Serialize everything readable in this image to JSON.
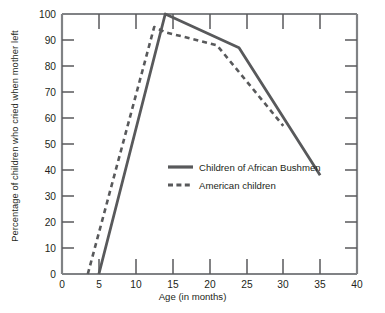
{
  "chart_data": {
    "type": "line",
    "title": "",
    "xlabel": "Age (in months)",
    "ylabel": "Percentage of children who cried when mother left",
    "xlim": [
      0,
      40
    ],
    "ylim": [
      0,
      100
    ],
    "xticks": [
      0,
      5,
      10,
      15,
      20,
      25,
      30,
      35,
      40
    ],
    "yticks": [
      0,
      10,
      20,
      30,
      40,
      50,
      60,
      70,
      80,
      90,
      100
    ],
    "grid": false,
    "legend_position": "center",
    "line_color": "#58595b",
    "series": [
      {
        "name": "Children of African Bushmen",
        "style": "solid",
        "points": [
          [
            5,
            0
          ],
          [
            14,
            100
          ],
          [
            24,
            87
          ],
          [
            35,
            38
          ]
        ]
      },
      {
        "name": "American children",
        "style": "dashed",
        "points": [
          [
            3.5,
            0
          ],
          [
            12.5,
            95
          ],
          [
            14,
            93
          ],
          [
            21,
            88
          ],
          [
            30,
            57
          ]
        ]
      }
    ]
  },
  "axes": {
    "y_title": "Percentage of children who cried when mother left",
    "x_title": "Age (in months)",
    "y_tick_labels": [
      "0",
      "10",
      "20",
      "30",
      "40",
      "50",
      "60",
      "70",
      "80",
      "90",
      "100"
    ],
    "x_tick_labels": [
      "0",
      "5",
      "10",
      "15",
      "20",
      "25",
      "30",
      "35",
      "40"
    ]
  },
  "legend": {
    "items": [
      {
        "label": "Children of African Bushmen",
        "style": "solid"
      },
      {
        "label": "American children",
        "style": "dashed"
      }
    ]
  }
}
